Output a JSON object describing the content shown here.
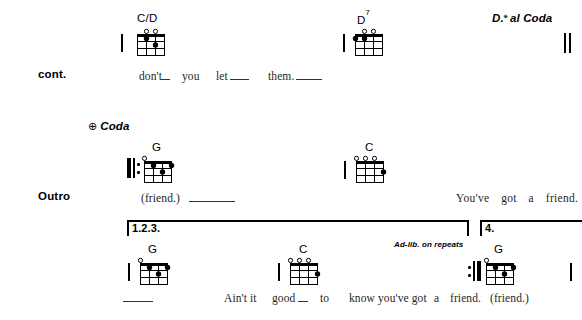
{
  "page": {
    "width": 582,
    "height": 320,
    "background": "#ffffff",
    "ink": "#000000",
    "lyric_color": "#262626"
  },
  "systems": [
    {
      "id": "system-1",
      "section_label": "cont.",
      "directions": [
        {
          "name": "ds-al-coda",
          "symbol": "𝄋",
          "text": "D. al Coda",
          "full": "D.S. al Coda"
        }
      ],
      "chords": [
        {
          "name": "C/D",
          "root": "C/D",
          "superscript": "",
          "strings": 4,
          "frets": 4,
          "open_strings": [
            1,
            2
          ],
          "muted_strings": [],
          "dots": [
            {
              "string": 2,
              "fret": 1
            },
            {
              "string": 3,
              "fret": 2
            }
          ]
        },
        {
          "name": "D7",
          "root": "D",
          "superscript": "7",
          "strings": 4,
          "frets": 4,
          "open_strings": [
            2,
            3
          ],
          "muted_strings": [],
          "dots": [
            {
              "string": 0,
              "fret": 1
            },
            {
              "string": 1,
              "fret": 1
            }
          ]
        }
      ],
      "lyrics": [
        {
          "text": "don't",
          "ext": true
        },
        {
          "text": "you",
          "ext": false
        },
        {
          "text": "let",
          "ext": true
        },
        {
          "text": "them.",
          "ext": true
        }
      ],
      "end_barline": "double"
    },
    {
      "id": "system-2",
      "section_label": "Outro",
      "directions": [
        {
          "name": "coda",
          "symbol": "⊕",
          "text": "Coda",
          "full": "Coda"
        }
      ],
      "chords": [
        {
          "name": "G",
          "root": "G",
          "superscript": "",
          "strings": 4,
          "frets": 4,
          "open_strings": [
            0
          ],
          "muted_strings": [],
          "dots": [
            {
              "string": 1,
              "fret": 1
            },
            {
              "string": 2,
              "fret": 2
            },
            {
              "string": 3,
              "fret": 1
            }
          ]
        },
        {
          "name": "C",
          "root": "C",
          "superscript": "",
          "strings": 4,
          "frets": 4,
          "open_strings": [
            0,
            1,
            2
          ],
          "muted_strings": [],
          "dots": [
            {
              "string": 3,
              "fret": 2
            }
          ]
        }
      ],
      "lyrics": [
        {
          "text": "(friend.)",
          "ext": true
        },
        {
          "text": "You've",
          "ext": false
        },
        {
          "text": "got",
          "ext": false
        },
        {
          "text": "a",
          "ext": false
        },
        {
          "text": "friend.",
          "ext": false
        }
      ],
      "start_barline": "repeat-start",
      "end_barline": "none"
    },
    {
      "id": "system-3",
      "section_label": "",
      "directions": [
        {
          "name": "ad-lib",
          "symbol": "",
          "text": "Ad-lib. on repeats",
          "full": "Ad-lib. on repeats"
        }
      ],
      "voltas": [
        {
          "label": "1.2.3."
        },
        {
          "label": "4."
        }
      ],
      "chords": [
        {
          "name": "G",
          "root": "G",
          "superscript": "",
          "strings": 4,
          "frets": 4,
          "open_strings": [
            0
          ],
          "muted_strings": [],
          "dots": [
            {
              "string": 1,
              "fret": 1
            },
            {
              "string": 2,
              "fret": 2
            },
            {
              "string": 3,
              "fret": 1
            }
          ]
        },
        {
          "name": "C",
          "root": "C",
          "superscript": "",
          "strings": 4,
          "frets": 4,
          "open_strings": [
            0,
            1,
            2
          ],
          "muted_strings": [],
          "dots": [
            {
              "string": 3,
              "fret": 2
            }
          ]
        },
        {
          "name": "G",
          "root": "G",
          "superscript": "",
          "strings": 4,
          "frets": 4,
          "open_strings": [
            0
          ],
          "muted_strings": [],
          "dots": [
            {
              "string": 1,
              "fret": 1
            },
            {
              "string": 2,
              "fret": 2
            },
            {
              "string": 3,
              "fret": 1
            }
          ]
        }
      ],
      "lyrics": [
        {
          "text": "",
          "ext": true
        },
        {
          "text": "Ain't",
          "ext": false
        },
        {
          "text": "it",
          "ext": false
        },
        {
          "text": "good",
          "ext": true
        },
        {
          "text": "to",
          "ext": false
        },
        {
          "text": "know",
          "ext": false
        },
        {
          "text": "you've",
          "ext": false
        },
        {
          "text": "got",
          "ext": false
        },
        {
          "text": "a",
          "ext": false
        },
        {
          "text": "friend.",
          "ext": false
        },
        {
          "text": "(friend.)",
          "ext": false
        }
      ],
      "end_barline": "thin"
    }
  ],
  "text": {
    "cont_label": "cont.",
    "outro_label": "Outro",
    "ds_al_coda": "al Coda",
    "ds_prefix": "D.",
    "segno": "𝄌",
    "coda_word": "Coda",
    "coda_symbol": "⊕",
    "adlib": "Ad-lib. on repeats",
    "volta_123": "1.2.3.",
    "volta_4": "4.",
    "chord_cd": "C/D",
    "chord_d": "D",
    "chord_d_sup": "7",
    "chord_g": "G",
    "chord_c": "C",
    "lyric_dont": "don't",
    "lyric_you": "you",
    "lyric_let": "let",
    "lyric_them": "them.",
    "lyric_friend_paren": "(friend.)",
    "lyric_youve_got_a_friend": "You've got a friend.",
    "lyric_aint_it": "Ain't it",
    "lyric_good": "good",
    "lyric_to": "to",
    "lyric_know_youve_got": "know you've got",
    "lyric_a": "a",
    "lyric_friend": "friend.",
    "lyric_friend_paren2": "(friend.)"
  }
}
